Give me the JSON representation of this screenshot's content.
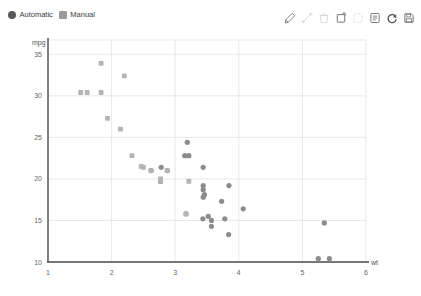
{
  "legend": {
    "items": [
      {
        "label": "Automatic",
        "marker": "circle",
        "color": "#595959"
      },
      {
        "label": "Manual",
        "marker": "square",
        "color": "#9a9a9a"
      }
    ]
  },
  "toolbar": {
    "items": [
      {
        "name": "edit-pencil-icon",
        "label": "Edit",
        "enabled": true
      },
      {
        "name": "line-tool-icon",
        "label": "Line",
        "enabled": false
      },
      {
        "name": "trash-icon",
        "label": "Delete",
        "enabled": false
      },
      {
        "name": "crop-frame-icon",
        "label": "Crop",
        "enabled": true
      },
      {
        "name": "select-box-icon",
        "label": "Select",
        "enabled": false
      },
      {
        "name": "list-view-icon",
        "label": "Data View",
        "enabled": true
      },
      {
        "name": "refresh-icon",
        "label": "Refresh",
        "enabled": true
      },
      {
        "name": "save-disk-icon",
        "label": "Save",
        "enabled": true
      }
    ]
  },
  "chart_data": {
    "type": "scatter",
    "title": "",
    "xlabel": "wt",
    "ylabel": "mpg",
    "xlim": [
      1,
      6
    ],
    "ylim": [
      10,
      36
    ],
    "xticks": [
      1,
      2,
      3,
      4,
      5,
      6
    ],
    "yticks": [
      10,
      15,
      20,
      25,
      30,
      35
    ],
    "grid": true,
    "legend_position": "top-left",
    "series": [
      {
        "name": "Automatic",
        "marker": "circle",
        "color": "#8c8c8c",
        "points": [
          [
            2.62,
            21.0
          ],
          [
            2.875,
            21.0
          ],
          [
            3.215,
            22.8
          ],
          [
            3.44,
            21.4
          ],
          [
            3.44,
            18.7
          ],
          [
            3.46,
            18.1
          ],
          [
            3.57,
            14.3
          ],
          [
            3.19,
            24.4
          ],
          [
            3.15,
            22.8
          ],
          [
            3.44,
            19.2
          ],
          [
            3.44,
            17.8
          ],
          [
            4.07,
            16.4
          ],
          [
            3.73,
            17.3
          ],
          [
            3.78,
            15.2
          ],
          [
            5.25,
            10.4
          ],
          [
            5.424,
            10.4
          ],
          [
            5.345,
            14.7
          ],
          [
            3.52,
            15.5
          ],
          [
            3.435,
            15.2
          ],
          [
            3.84,
            13.3
          ],
          [
            3.845,
            19.2
          ],
          [
            3.17,
            15.8
          ],
          [
            2.77,
            19.7
          ],
          [
            3.57,
            15.0
          ],
          [
            2.78,
            21.4
          ]
        ]
      },
      {
        "name": "Manual",
        "marker": "square",
        "color": "#b4b4b4",
        "points": [
          [
            1.615,
            30.4
          ],
          [
            1.835,
            30.4
          ],
          [
            1.935,
            27.3
          ],
          [
            2.14,
            26.0
          ],
          [
            1.513,
            30.4
          ],
          [
            1.835,
            33.9
          ],
          [
            2.2,
            32.4
          ],
          [
            2.32,
            22.8
          ],
          [
            2.465,
            21.5
          ],
          [
            2.62,
            21.0
          ],
          [
            2.875,
            21.0
          ],
          [
            3.215,
            19.7
          ],
          [
            2.77,
            19.7
          ],
          [
            3.17,
            15.8
          ],
          [
            2.77,
            20.0
          ],
          [
            2.5,
            21.4
          ]
        ]
      }
    ]
  }
}
